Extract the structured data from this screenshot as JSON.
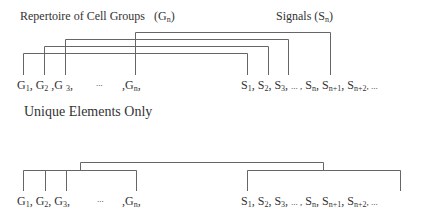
{
  "top": {
    "groups_title": "Repertoire of Cell Groups",
    "groups_symbol": "(G",
    "groups_symbol_sub": "n",
    "groups_symbol_close": ")",
    "signals_title": "Signals",
    "signals_symbol": "(S",
    "signals_symbol_sub": "n",
    "signals_symbol_close": ")",
    "groups_sequence": [
      "G",
      "1",
      ", G",
      "2",
      " ,G ",
      "3",
      ",",
      "...",
      ",G",
      "n",
      ","
    ],
    "signals_sequence": [
      "S",
      "1",
      ", S",
      "2",
      ", S",
      "3",
      ",",
      "... ,",
      "S",
      "n",
      ", S",
      "n+1",
      ", S",
      "n+2",
      ", ..."
    ]
  },
  "section_label": "Unique Elements Only",
  "bottom": {
    "groups_sequence": [
      "G",
      "1",
      ", G",
      "2",
      ", G",
      "3",
      ",",
      "...",
      ",G",
      "n",
      ","
    ],
    "signals_sequence": [
      "S",
      "1",
      ", S",
      "2",
      ", S",
      "3",
      ",",
      "... ,",
      "S",
      "n",
      ", S",
      "n+1",
      ", S",
      "n+2",
      ", ..."
    ]
  },
  "colors": {
    "line": "#666666",
    "text": "#333333"
  }
}
